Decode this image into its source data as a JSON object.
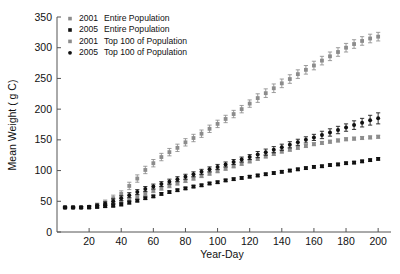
{
  "chart_data": {
    "type": "scatter",
    "title": "",
    "xlabel": "Year-Day",
    "ylabel": "Mean Weight ( g C)",
    "xlim": [
      0,
      208
    ],
    "ylim": [
      0,
      350
    ],
    "xticks": [
      20,
      40,
      60,
      80,
      100,
      120,
      140,
      160,
      180,
      200
    ],
    "yticks": [
      0,
      50,
      100,
      150,
      200,
      250,
      300,
      350
    ],
    "grid": false,
    "legend_position": "upper-left",
    "errorbars": true,
    "x": [
      5,
      10,
      15,
      20,
      25,
      30,
      35,
      40,
      45,
      50,
      55,
      60,
      65,
      70,
      75,
      80,
      85,
      90,
      95,
      100,
      105,
      110,
      115,
      120,
      125,
      130,
      135,
      140,
      145,
      150,
      155,
      160,
      165,
      170,
      175,
      180,
      185,
      190,
      195,
      200
    ],
    "series": [
      {
        "name": "2001  Entire Population",
        "year": "2001",
        "group": "Entire Population",
        "color": "#8c8c8c",
        "marker": "square",
        "values": [
          40,
          40,
          40,
          40,
          41,
          43,
          45,
          48,
          52,
          57,
          62,
          67,
          71,
          75,
          79,
          83,
          87,
          91,
          95,
          99,
          103,
          107,
          111,
          115,
          119,
          123,
          127,
          131,
          134,
          137,
          140,
          143,
          145,
          147,
          149,
          151,
          152,
          153,
          154,
          155
        ],
        "errors": [
          1,
          1,
          1.5,
          2,
          2.5,
          3,
          3.5,
          3,
          3,
          3,
          3,
          3,
          3,
          3,
          2.5,
          2.5,
          2.5,
          2.5,
          2.5,
          2.5,
          2.5,
          2.5,
          2.5,
          2.5,
          2.5,
          2.5,
          2.5,
          2.5,
          2.5,
          2.5,
          2.5,
          2.5,
          2.5,
          2.5,
          2.5,
          2.5,
          2.5,
          2.5,
          2.5,
          2.5
        ]
      },
      {
        "name": "2005  Entire Population",
        "year": "2005",
        "group": "Entire Population",
        "color": "#111111",
        "marker": "square",
        "values": [
          40,
          40,
          40,
          40,
          41,
          42,
          43,
          45,
          48,
          51,
          55,
          58,
          62,
          65,
          68,
          71,
          74,
          76,
          79,
          81,
          84,
          86,
          88,
          90,
          92,
          94,
          96,
          98,
          100,
          102,
          104,
          106,
          107,
          109,
          110,
          112,
          113,
          115,
          117,
          119
        ],
        "errors": [
          1,
          1,
          1,
          1.5,
          2,
          2,
          2.5,
          2.5,
          2.5,
          2,
          2,
          2,
          2,
          2,
          2,
          2,
          2,
          2,
          2,
          2,
          2,
          2,
          2,
          2,
          2,
          2,
          2,
          2,
          2,
          2,
          2,
          2,
          2,
          2,
          2,
          2,
          2,
          2,
          2,
          2
        ]
      },
      {
        "name": "2001  Top 100 of Population",
        "year": "2001",
        "group": "Top 100 of Population",
        "color": "#8c8c8c",
        "marker": "square",
        "values": [
          40,
          40,
          40,
          41,
          44,
          48,
          55,
          62,
          75,
          87,
          101,
          112,
          122,
          130,
          137,
          146,
          153,
          160,
          168,
          176,
          184,
          192,
          200,
          209,
          218,
          226,
          234,
          242,
          249,
          257,
          264,
          271,
          279,
          286,
          293,
          300,
          306,
          311,
          315,
          318
        ],
        "errors": [
          1,
          1,
          1.5,
          2,
          3,
          4,
          5,
          5,
          6,
          6,
          6,
          6,
          6,
          6,
          6,
          6,
          6,
          6,
          6,
          6,
          6,
          6,
          6,
          6,
          7,
          7,
          7,
          7,
          7,
          7,
          7,
          7,
          7,
          7,
          7,
          7,
          7,
          7,
          7,
          7
        ]
      },
      {
        "name": "2005  Top 100 of Population",
        "year": "2005",
        "group": "Top 100 of Population",
        "color": "#111111",
        "marker": "circle",
        "values": [
          40,
          40,
          40,
          41,
          43,
          46,
          50,
          55,
          60,
          65,
          70,
          74,
          78,
          82,
          86,
          90,
          94,
          98,
          102,
          106,
          110,
          114,
          118,
          122,
          126,
          130,
          134,
          138,
          142,
          146,
          150,
          154,
          158,
          162,
          166,
          170,
          174,
          178,
          182,
          185
        ],
        "errors": [
          1,
          1,
          1.5,
          2,
          2.5,
          3,
          4,
          4,
          4,
          4,
          4,
          4,
          4,
          4,
          4,
          4,
          4,
          4,
          4,
          4,
          4,
          4,
          4,
          4,
          5,
          5,
          5,
          5,
          5,
          5,
          5,
          5,
          6,
          6,
          6,
          6,
          7,
          7,
          8,
          9
        ]
      }
    ],
    "legend": [
      {
        "label_year": "2001",
        "label_group": "Entire Population",
        "color": "#8c8c8c",
        "marker": "square"
      },
      {
        "label_year": "2005",
        "label_group": "Entire Population",
        "color": "#111111",
        "marker": "square"
      },
      {
        "label_year": "2001",
        "label_group": "Top 100 of Population",
        "color": "#8c8c8c",
        "marker": "square"
      },
      {
        "label_year": "2005",
        "label_group": "Top 100 of Population",
        "color": "#111111",
        "marker": "circle"
      }
    ]
  }
}
